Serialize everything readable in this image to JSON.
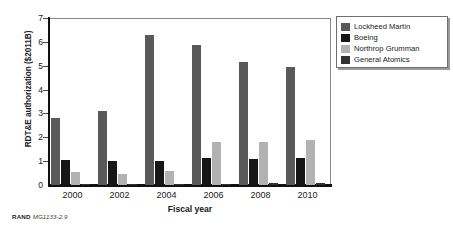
{
  "chart_data": {
    "type": "bar",
    "title": "",
    "xlabel": "Fiscal year",
    "ylabel": "RDT&E authorization ($2011B)",
    "categories": [
      "2000",
      "2002",
      "2004",
      "2006",
      "2008",
      "2010"
    ],
    "series": [
      {
        "name": "Lockheed Martin",
        "color": "#595959",
        "values": [
          2.8,
          3.1,
          6.3,
          5.85,
          5.15,
          4.95
        ]
      },
      {
        "name": "Boeing",
        "color": "#161616",
        "values": [
          1.05,
          1.0,
          1.0,
          1.15,
          1.1,
          1.15
        ]
      },
      {
        "name": "Northrop Grumman",
        "color": "#b2b2b2",
        "values": [
          0.55,
          0.45,
          0.6,
          1.8,
          1.8,
          1.9
        ]
      },
      {
        "name": "General Atomics",
        "color": "#333333",
        "values": [
          0.01,
          0.01,
          0.01,
          0.05,
          0.07,
          0.09
        ]
      }
    ],
    "ylim": [
      0,
      7
    ],
    "yticks": [
      0,
      1,
      2,
      3,
      4,
      5,
      6,
      7
    ],
    "ytick_labels": [
      "0",
      "1",
      "2",
      "3",
      "4",
      "5",
      "6",
      "7"
    ],
    "grid": false,
    "legend_position": "right-top"
  },
  "footer": {
    "brand": "RAND",
    "figure_id": "MG1133-2.9"
  }
}
